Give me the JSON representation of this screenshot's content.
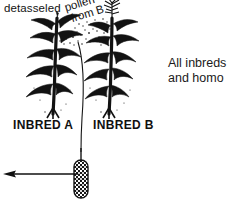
{
  "diagram": {
    "labels": {
      "detasseled": "detasseled",
      "pollen_line1": "pollen",
      "pollen_line2": "from B",
      "inbred_a": "INBRED A",
      "inbred_b": "INBRED B"
    },
    "note": {
      "line1": "All inbreds",
      "line2": "and homo"
    },
    "colors": {
      "ink": "#101010",
      "background": "#ffffff"
    },
    "elements": {
      "left_plant": "corn-plant-detasseled",
      "right_plant": "corn-plant-with-tassel",
      "pollen": "pollen-cloud",
      "ear": "corn-ear",
      "arrow": "harvest-arrow-left"
    }
  }
}
